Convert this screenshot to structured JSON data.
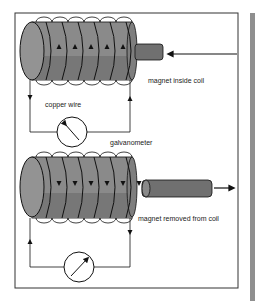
{
  "labels": {
    "magnet_inside": "magnet inside coil",
    "copper_wire": "copper wire",
    "galvanometer": "galvanometer",
    "magnet_removed": "magnet removed from coil"
  },
  "colors": {
    "coil_body": "#8a8a8a",
    "coil_shadow": "#6e6e6e",
    "magnet": "#7a7a7a",
    "line": "#111111",
    "side_bar": "#8f8f8f"
  }
}
